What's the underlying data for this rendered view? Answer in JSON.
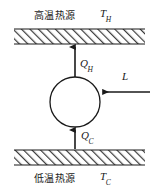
{
  "figure": {
    "type": "thermodynamic-cycle-diagram",
    "background_color": "#ffffff",
    "line_color": "#1a1a1a"
  },
  "reservoirs": {
    "hot": {
      "name_cn": "高温热源",
      "temperature_symbol": "T",
      "temperature_subscript": "H",
      "band": {
        "x": 14,
        "y": 29,
        "width": 131,
        "height": 15
      }
    },
    "cold": {
      "name_cn": "低温热源",
      "temperature_symbol": "T",
      "temperature_subscript": "C",
      "band": {
        "x": 14,
        "y": 150,
        "width": 131,
        "height": 15
      }
    }
  },
  "engine": {
    "shape": "circle",
    "center_x": 75,
    "center_y": 102,
    "radius": 25
  },
  "flows": [
    {
      "id": "heat-out-hot",
      "symbol": "Q",
      "subscript": "H",
      "direction": "up",
      "from": "engine",
      "to": "hot-reservoir"
    },
    {
      "id": "heat-in-cold",
      "symbol": "Q",
      "subscript": "C",
      "direction": "up",
      "from": "cold-reservoir",
      "to": "engine"
    },
    {
      "id": "work-input",
      "symbol": "L",
      "subscript": "",
      "direction": "left",
      "from": "external",
      "to": "engine"
    }
  ]
}
